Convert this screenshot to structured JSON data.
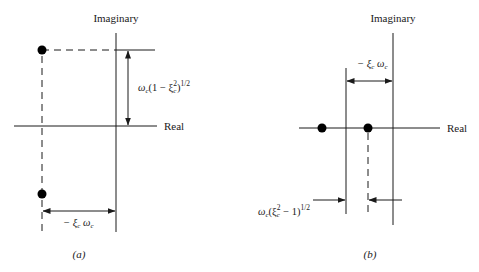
{
  "figure": {
    "panel_a": {
      "caption": "(a)",
      "axes": {
        "imaginary_label": "Imaginary",
        "real_label": "Real"
      },
      "poles": [
        {
          "name": "upper-complex-pole",
          "x": 42,
          "y": 50
        },
        {
          "name": "lower-complex-pole",
          "x": 42,
          "y": 194
        }
      ],
      "annotations": {
        "imag_part": {
          "omega": "ω",
          "omega_sub": "c",
          "body": "(1 − ξ",
          "xi_sub": "c",
          "sq": "2",
          "close": ")",
          "pow": "1/2"
        },
        "real_part": {
          "minus_xi": "− ξ",
          "xi_sub": "c",
          "omega": " ω",
          "omega_sub": "c"
        }
      }
    },
    "panel_b": {
      "caption": "(b)",
      "axes": {
        "imaginary_label": "Imaginary",
        "real_label": "Real"
      },
      "poles": [
        {
          "name": "left-real-pole",
          "x": 322,
          "y": 128
        },
        {
          "name": "right-real-pole",
          "x": 368,
          "y": 128
        }
      ],
      "annotations": {
        "center_offset": {
          "minus_xi": "− ξ",
          "xi_sub": "c",
          "omega": " ω",
          "omega_sub": "c"
        },
        "spread": {
          "omega": "ω",
          "omega_sub": "c",
          "open": "(ξ",
          "xi_sub": "c",
          "sq": "2",
          "body": " − 1)",
          "pow": "1/2"
        }
      }
    }
  }
}
